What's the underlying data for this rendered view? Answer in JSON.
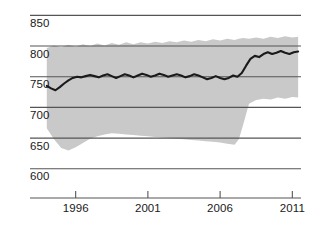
{
  "chart_data": {
    "type": "line",
    "title": "",
    "subtitle": "",
    "xlabel": "",
    "ylabel": "",
    "xlim": [
      1993.6,
      2011.6
    ],
    "ylim": [
      585,
      862
    ],
    "grid": true,
    "grid_axis": "y",
    "legend": "none",
    "colors": {
      "line": "#1a1a1a",
      "band": "#c9c9c9",
      "grid": "#555555",
      "axis": "#555555",
      "text": "#1a1a1a",
      "background": "#ffffff"
    },
    "y_ticks": [
      600,
      650,
      700,
      750,
      800,
      850
    ],
    "y_tick_labels": [
      "600",
      "650",
      "700",
      "750",
      "800",
      "850"
    ],
    "x_ticks": [
      1996,
      2001,
      2006,
      2011
    ],
    "x_tick_labels": [
      "1996",
      "2001",
      "2006",
      "2011"
    ],
    "series": [
      {
        "name": "estimate",
        "type": "line",
        "x": [
          1994.0,
          1994.3,
          1994.6,
          1994.9,
          1995.2,
          1995.5,
          1995.8,
          1996.1,
          1996.4,
          1996.7,
          1997.0,
          1997.3,
          1997.6,
          1997.9,
          1998.2,
          1998.5,
          1998.8,
          1999.1,
          1999.4,
          1999.7,
          2000.0,
          2000.3,
          2000.6,
          2000.9,
          2001.2,
          2001.5,
          2001.8,
          2002.1,
          2002.4,
          2002.7,
          2003.0,
          2003.3,
          2003.6,
          2003.9,
          2004.2,
          2004.5,
          2004.8,
          2005.1,
          2005.4,
          2005.7,
          2006.0,
          2006.3,
          2006.6,
          2006.9,
          2007.2,
          2007.5,
          2007.8,
          2008.1,
          2008.4,
          2008.7,
          2009.0,
          2009.3,
          2009.6,
          2009.9,
          2010.2,
          2010.5,
          2010.8,
          2011.1,
          2011.4
        ],
        "values": [
          735,
          731,
          728,
          733,
          739,
          744,
          748,
          750,
          749,
          751,
          753,
          751,
          749,
          752,
          754,
          751,
          748,
          751,
          754,
          752,
          749,
          752,
          755,
          753,
          750,
          752,
          755,
          753,
          750,
          752,
          754,
          752,
          749,
          751,
          754,
          752,
          749,
          746,
          748,
          751,
          748,
          746,
          748,
          752,
          750,
          756,
          768,
          779,
          784,
          782,
          787,
          790,
          787,
          789,
          792,
          789,
          787,
          790,
          791
        ]
      },
      {
        "name": "uncertainty-band",
        "type": "band",
        "x": [
          1994.0,
          1994.5,
          1995.0,
          1995.5,
          1996.0,
          1996.5,
          1997.0,
          1997.5,
          1998.0,
          1998.5,
          1999.0,
          1999.5,
          2000.0,
          2000.5,
          2001.0,
          2001.5,
          2002.0,
          2002.5,
          2003.0,
          2003.5,
          2004.0,
          2004.5,
          2005.0,
          2005.5,
          2006.0,
          2006.5,
          2007.0,
          2007.3,
          2007.6,
          2008.0,
          2008.5,
          2009.0,
          2009.5,
          2010.0,
          2010.5,
          2011.0,
          2011.4
        ],
        "upper": [
          797,
          801,
          798,
          802,
          799,
          803,
          800,
          804,
          801,
          805,
          802,
          806,
          803,
          806,
          804,
          807,
          805,
          808,
          806,
          809,
          807,
          810,
          808,
          811,
          809,
          812,
          810,
          812,
          813,
          812,
          814,
          812,
          815,
          813,
          816,
          814,
          815
        ],
        "lower": [
          666,
          648,
          634,
          630,
          635,
          642,
          649,
          653,
          656,
          658,
          657,
          656,
          655,
          654,
          653,
          652,
          651,
          650,
          649,
          648,
          647,
          646,
          645,
          644,
          643,
          641,
          639,
          648,
          672,
          706,
          712,
          714,
          713,
          716,
          714,
          717,
          716
        ]
      }
    ],
    "annotations": []
  },
  "axis": {
    "y_labels": [
      "850",
      "800",
      "750",
      "700",
      "650",
      "600"
    ],
    "x_labels": [
      "1996",
      "2001",
      "2006",
      "2011"
    ]
  }
}
